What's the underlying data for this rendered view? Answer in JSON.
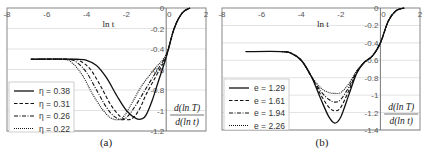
{
  "chart_data": [
    {
      "type": "line",
      "panel_label": "(a)",
      "xlabel": "ln t",
      "ylabel": "d(ln T) / d(ln t)",
      "xlim": [
        -8,
        2
      ],
      "ylim": [
        -1.2,
        0
      ],
      "x_ticks": [
        "-8",
        "-6",
        "-4",
        "-2",
        "0",
        "2"
      ],
      "y_ticks": [
        "0",
        "-0.2",
        "-0.4",
        "-0.6",
        "-0.8",
        "-1",
        "-1.2"
      ],
      "grid": true,
      "legend_position": "lower-left",
      "series": [
        {
          "name": "η = 0.38",
          "style": "solid",
          "x": [
            -6.8,
            -4.5,
            -4,
            -3.5,
            -3,
            -2.5,
            -2,
            -1.5,
            -1.2,
            -1,
            -0.7,
            -0.4,
            0,
            0.4,
            0.8,
            1.2
          ],
          "y": [
            -0.5,
            -0.5,
            -0.51,
            -0.56,
            -0.68,
            -0.85,
            -1.0,
            -1.08,
            -1.08,
            -1.04,
            -0.9,
            -0.72,
            -0.48,
            -0.2,
            -0.05,
            0
          ]
        },
        {
          "name": "η = 0.31",
          "style": "dashed",
          "x": [
            -6.8,
            -4.8,
            -4.3,
            -3.8,
            -3.3,
            -2.8,
            -2.3,
            -1.9,
            -1.6,
            -1.3,
            -1,
            -0.5,
            0,
            0.4,
            0.8,
            1.2
          ],
          "y": [
            -0.5,
            -0.5,
            -0.52,
            -0.6,
            -0.76,
            -0.94,
            -1.06,
            -1.09,
            -1.06,
            -0.97,
            -0.84,
            -0.66,
            -0.47,
            -0.2,
            -0.05,
            0
          ]
        },
        {
          "name": "η = 0.26",
          "style": "dashdot",
          "x": [
            -6.8,
            -5,
            -4.5,
            -4,
            -3.5,
            -3,
            -2.6,
            -2.2,
            -1.9,
            -1.5,
            -1,
            -0.5,
            0,
            0.4,
            0.8,
            1.2
          ],
          "y": [
            -0.5,
            -0.5,
            -0.53,
            -0.63,
            -0.8,
            -0.97,
            -1.06,
            -1.09,
            -1.05,
            -0.94,
            -0.78,
            -0.62,
            -0.46,
            -0.2,
            -0.05,
            0
          ]
        },
        {
          "name": "η = 0.22",
          "style": "dotted",
          "x": [
            -6.8,
            -5.2,
            -4.7,
            -4.2,
            -3.7,
            -3.2,
            -2.8,
            -2.4,
            -2.1,
            -1.7,
            -1.2,
            -0.6,
            0,
            0.4,
            0.8,
            1.2
          ],
          "y": [
            -0.5,
            -0.5,
            -0.54,
            -0.66,
            -0.84,
            -0.99,
            -1.07,
            -1.09,
            -1.05,
            -0.92,
            -0.75,
            -0.6,
            -0.45,
            -0.2,
            -0.05,
            0
          ]
        }
      ]
    },
    {
      "type": "line",
      "panel_label": "(b)",
      "xlabel": "ln t",
      "ylabel": "d(ln T) / d(ln t)",
      "xlim": [
        -8,
        2
      ],
      "ylim": [
        -1.4,
        0
      ],
      "x_ticks": [
        "-8",
        "-6",
        "-4",
        "-2",
        "0",
        "2"
      ],
      "y_ticks": [
        "0",
        "-0.2",
        "-0.4",
        "-0.6",
        "-0.8",
        "-1",
        "-1.2",
        "-1.4"
      ],
      "grid": true,
      "legend_position": "lower-left",
      "series": [
        {
          "name": "e = 1.29",
          "style": "solid",
          "x": [
            -6.8,
            -5,
            -4.5,
            -4,
            -3.5,
            -3,
            -2.6,
            -2.3,
            -2,
            -1.6,
            -1.2,
            -0.8,
            -0.4,
            0,
            0.4,
            0.8,
            1.2
          ],
          "y": [
            -0.5,
            -0.5,
            -0.52,
            -0.6,
            -0.78,
            -1.05,
            -1.25,
            -1.32,
            -1.25,
            -1.0,
            -0.75,
            -0.62,
            -0.55,
            -0.4,
            -0.15,
            -0.03,
            0
          ]
        },
        {
          "name": "e = 1.61",
          "style": "dashed",
          "x": [
            -6.8,
            -5,
            -4.5,
            -4,
            -3.5,
            -3,
            -2.6,
            -2.3,
            -2,
            -1.6,
            -1.2,
            -0.8,
            -0.4,
            0,
            0.4,
            0.8,
            1.2
          ],
          "y": [
            -0.5,
            -0.5,
            -0.52,
            -0.6,
            -0.78,
            -1.0,
            -1.14,
            -1.18,
            -1.14,
            -0.95,
            -0.74,
            -0.62,
            -0.55,
            -0.4,
            -0.15,
            -0.03,
            0
          ]
        },
        {
          "name": "e = 1.94",
          "style": "dashdot",
          "x": [
            -6.8,
            -5,
            -4.5,
            -4,
            -3.5,
            -3,
            -2.6,
            -2.3,
            -2,
            -1.6,
            -1.2,
            -0.8,
            -0.4,
            0,
            0.4,
            0.8,
            1.2
          ],
          "y": [
            -0.5,
            -0.5,
            -0.52,
            -0.6,
            -0.78,
            -0.96,
            -1.05,
            -1.08,
            -1.05,
            -0.91,
            -0.73,
            -0.62,
            -0.55,
            -0.4,
            -0.15,
            -0.03,
            0
          ]
        },
        {
          "name": "e = 2.26",
          "style": "dotted",
          "x": [
            -6.8,
            -5,
            -4.5,
            -4,
            -3.5,
            -3,
            -2.6,
            -2.3,
            -2,
            -1.6,
            -1.2,
            -0.8,
            -0.4,
            0,
            0.4,
            0.8,
            1.2
          ],
          "y": [
            -0.5,
            -0.5,
            -0.52,
            -0.6,
            -0.78,
            -0.92,
            -0.97,
            -0.98,
            -0.97,
            -0.87,
            -0.72,
            -0.62,
            -0.55,
            -0.4,
            -0.15,
            -0.03,
            0
          ]
        }
      ]
    }
  ],
  "labels": {
    "xlabel": "ln t",
    "ylabel_num": "d(ln T)",
    "ylabel_den": "d(ln t)",
    "panel_a": "(a)",
    "panel_b": "(b)"
  }
}
